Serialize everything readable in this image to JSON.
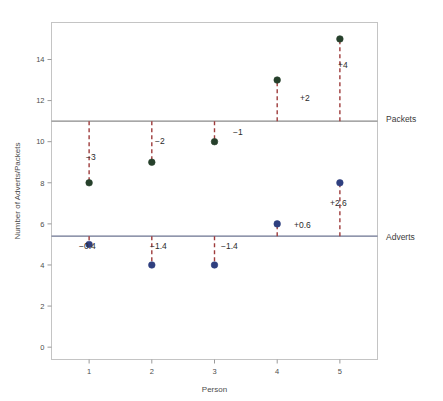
{
  "chart_data": {
    "type": "scatter",
    "title": "",
    "xlabel": "Person",
    "ylabel": "Number of Adverts/Packets",
    "x": [
      1,
      2,
      3,
      4,
      5
    ],
    "xlim": [
      0.4,
      5.6
    ],
    "ylim": [
      -0.6,
      15.8
    ],
    "xticks": [
      "1",
      "2",
      "3",
      "4",
      "5"
    ],
    "yticks": [
      "0",
      "2",
      "4",
      "6",
      "8",
      "10",
      "12",
      "14"
    ],
    "ytick_values": [
      0,
      2,
      4,
      6,
      8,
      10,
      12,
      14
    ],
    "grid": false,
    "legend_position": "right-inline",
    "series": [
      {
        "name": "Packets",
        "color": "#26402b",
        "marker": "filled-circle",
        "values": [
          8,
          9,
          10,
          13,
          15
        ],
        "reference_line": 11,
        "reference_line_color": "#8a8a8a",
        "reference_label": "Packets",
        "residual_labels": [
          "−3",
          "−2",
          "−1",
          "+2",
          "+4"
        ],
        "residuals": [
          -3,
          -2,
          -1,
          2,
          4
        ]
      },
      {
        "name": "Adverts",
        "color": "#2f3f7f",
        "marker": "filled-circle",
        "values": [
          5,
          4,
          4,
          6,
          8
        ],
        "reference_line": 5.4,
        "reference_line_color": "#6b7390",
        "reference_label": "Adverts",
        "residual_labels": [
          "−0.4",
          "−1.4",
          "−1.4",
          "+0.6",
          "+2.6"
        ],
        "residuals": [
          -0.4,
          -1.4,
          -1.4,
          0.6,
          2.6
        ]
      }
    ],
    "connector_style": {
      "color": "#9e3b3b",
      "dash": "4 3",
      "width": 1.4
    },
    "frame_color": "#bfbfbf",
    "background": "#ffffff"
  },
  "annotations": {
    "packets": [
      {
        "text": "−3",
        "x": 86,
        "y": 160
      },
      {
        "text": "−2",
        "x": 155,
        "y": 144
      },
      {
        "text": "−1",
        "x": 233,
        "y": 135
      },
      {
        "text": "+2",
        "x": 300,
        "y": 101
      },
      {
        "text": "+4",
        "x": 338,
        "y": 68
      }
    ],
    "adverts": [
      {
        "text": "−0.4",
        "x": 79,
        "y": 249
      },
      {
        "text": "−1.4",
        "x": 150,
        "y": 249
      },
      {
        "text": "−1.4",
        "x": 221,
        "y": 249
      },
      {
        "text": "+0.6",
        "x": 294,
        "y": 228
      },
      {
        "text": "+2.6",
        "x": 330,
        "y": 206
      }
    ]
  },
  "reference_labels": {
    "packets": {
      "text": "Packets",
      "x": 386,
      "y": 122
    },
    "adverts": {
      "text": "Adverts",
      "x": 386,
      "y": 240
    }
  }
}
